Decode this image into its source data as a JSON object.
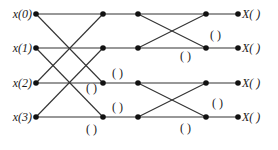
{
  "diagram": {
    "type": "FFT butterfly flow graph (4-point, decimation-in-time)",
    "inputs": [
      "x(0)",
      "x(1)",
      "x(2)",
      "x(3)"
    ],
    "outputs": [
      "X(   )",
      "X(   )",
      "X(   )",
      "X(   )"
    ],
    "blank_label": "(   )",
    "colors": {
      "line": "#333333",
      "node": "#111111",
      "text": "#1a1a1a",
      "background": "#ffffff"
    },
    "rows_y": [
      14,
      48,
      83,
      117
    ],
    "columns_x": {
      "input": 36,
      "stage1": 103,
      "stage2": 138,
      "stage3": 206,
      "output": 238
    },
    "blank_labels_positions": [
      {
        "x": 119,
        "y": 79
      },
      {
        "x": 93,
        "y": 90
      },
      {
        "x": 119,
        "y": 112
      },
      {
        "x": 93,
        "y": 134
      },
      {
        "x": 214,
        "y": 40
      },
      {
        "x": 184,
        "y": 58
      },
      {
        "x": 214,
        "y": 108
      },
      {
        "x": 184,
        "y": 131
      }
    ]
  }
}
